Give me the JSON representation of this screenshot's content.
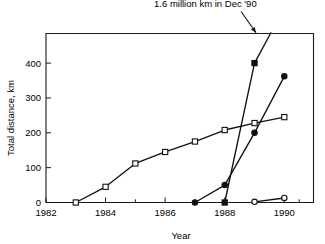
{
  "chart_data": {
    "type": "line",
    "title": "",
    "xlabel": "Year",
    "ylabel": "Total distance, km",
    "xlim": [
      1982,
      1990.98
    ],
    "ylim": [
      0,
      485
    ],
    "grid": false,
    "legend": "none",
    "x_ticks": [
      1982,
      1984,
      1986,
      1988,
      1990
    ],
    "x_tick_labels": [
      "1982",
      "1984",
      "1986",
      "1988",
      "1990"
    ],
    "x_minor_ticks": [
      1983,
      1985,
      1987,
      1989,
      1990.5
    ],
    "y_ticks": [
      0,
      100,
      200,
      300,
      400
    ],
    "y_tick_labels": [
      "0",
      "100",
      "200",
      "300",
      "400"
    ],
    "annotations": [
      {
        "text": "1.6 million km in Dec '90",
        "text_x": 1987.35,
        "text_y": 560,
        "arrow_from_x": 1988.55,
        "arrow_from_y": 548,
        "arrow_to_x": 1989.05,
        "arrow_to_y": 487
      }
    ],
    "series": [
      {
        "name": "open-square-series",
        "marker": "open-square",
        "x": [
          1983,
          1984,
          1985,
          1986,
          1987,
          1988,
          1989,
          1990
        ],
        "values": [
          0,
          45,
          112,
          145,
          175,
          208,
          228,
          245
        ]
      },
      {
        "name": "filled-square-series",
        "marker": "filled-square",
        "x": [
          1988,
          1989,
          1989.55
        ],
        "values": [
          0,
          400,
          487
        ]
      },
      {
        "name": "filled-circle-series",
        "marker": "filled-circle",
        "x": [
          1987,
          1988,
          1989,
          1990
        ],
        "values": [
          0,
          50,
          200,
          362
        ]
      },
      {
        "name": "open-circle-series",
        "marker": "open-circle",
        "x": [
          1989,
          1990
        ],
        "values": [
          2,
          13
        ]
      }
    ]
  }
}
